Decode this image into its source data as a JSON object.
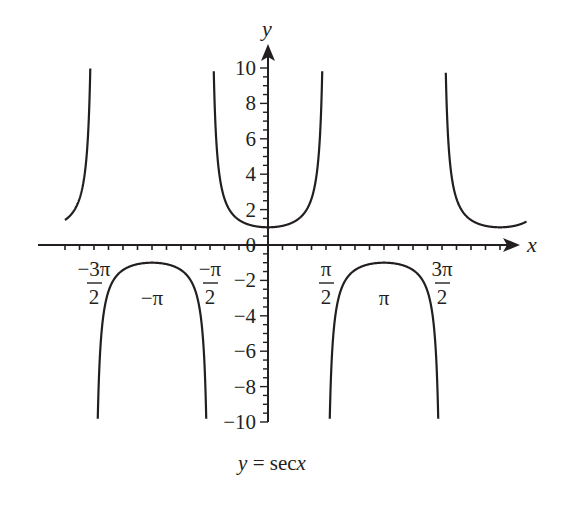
{
  "chart_data": {
    "type": "line",
    "title": "",
    "caption": "y = secx",
    "caption_parts": {
      "y": "y",
      "eq": " = sec",
      "x": "x"
    },
    "xlabel": "x",
    "ylabel": "y",
    "function": "sec(x)",
    "xlim": [
      -5.5,
      7.0
    ],
    "ylim": [
      -10,
      10
    ],
    "y_ticks": [
      -10,
      -8,
      -6,
      -4,
      -2,
      0,
      2,
      4,
      6,
      8,
      10
    ],
    "y_tick_labels": [
      "−10",
      "−8",
      "−6",
      "−4",
      "−2",
      "0",
      "2",
      "4",
      "6",
      "8",
      "10"
    ],
    "y_minor_tick_step": 0.5,
    "x_ticks_labeled": [
      {
        "value": "-3pi/2",
        "num": "−3π",
        "den": "2"
      },
      {
        "value": "-pi",
        "label": "−π"
      },
      {
        "value": "-pi/2",
        "num": "−π",
        "den": "2"
      },
      {
        "value": "pi/2",
        "num": "π",
        "den": "2"
      },
      {
        "value": "pi",
        "label": "π"
      },
      {
        "value": "3pi/2",
        "num": "3π",
        "den": "2"
      }
    ],
    "x_minor_tick_step": "pi/8",
    "asymptotes": [
      "-3pi/2",
      "-pi/2",
      "pi/2",
      "3pi/2"
    ],
    "branches": [
      {
        "x_range": [
          "-5.5",
          "-3pi/2"
        ],
        "sign": "+",
        "min_at": "-2pi",
        "min_value": 1
      },
      {
        "x_range": [
          "-3pi/2",
          "-pi/2"
        ],
        "sign": "-",
        "max_at": "-pi",
        "max_value": -1
      },
      {
        "x_range": [
          "-pi/2",
          "pi/2"
        ],
        "sign": "+",
        "min_at": "0",
        "min_value": 1
      },
      {
        "x_range": [
          "pi/2",
          "3pi/2"
        ],
        "sign": "-",
        "max_at": "pi",
        "max_value": -1
      },
      {
        "x_range": [
          "3pi/2",
          "7.0"
        ],
        "sign": "+",
        "min_at": "2pi",
        "min_value": 1
      }
    ],
    "grid": false,
    "legend": null,
    "colors": {
      "curve": "#231f20",
      "axes": "#231f20",
      "background": "#ffffff"
    }
  }
}
